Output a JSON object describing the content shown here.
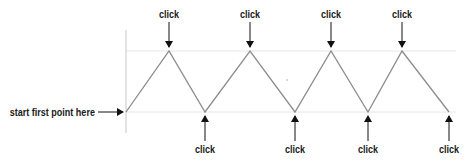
{
  "diagram": {
    "start_label": "start first point here",
    "click_label": "click",
    "colors": {
      "zigzag": "#8c8c8c",
      "gridline": "#e6e6e6",
      "axis": "#d0d0d0",
      "arrow": "#111111",
      "text": "#1a1a1a"
    },
    "top_clicks": [
      {
        "label": "click",
        "x": 169
      },
      {
        "label": "click",
        "x": 250
      },
      {
        "label": "click",
        "x": 331
      },
      {
        "label": "click",
        "x": 402
      }
    ],
    "bottom_clicks": [
      {
        "label": "click",
        "x": 205
      },
      {
        "label": "click",
        "x": 295
      },
      {
        "label": "click",
        "x": 368
      },
      {
        "label": "click",
        "x": 449
      }
    ]
  }
}
